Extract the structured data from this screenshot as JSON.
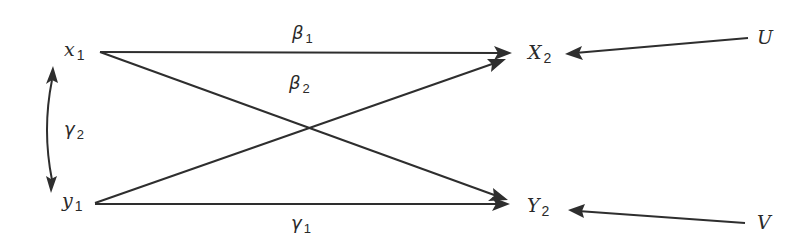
{
  "diagram": {
    "type": "path-diagram",
    "nodes": {
      "x1": {
        "base": "x",
        "sub": "1"
      },
      "y1": {
        "base": "y",
        "sub": "1"
      },
      "X2": {
        "base": "X",
        "sub": "2"
      },
      "Y2": {
        "base": "Y",
        "sub": "2"
      },
      "U": {
        "base": "U",
        "sub": ""
      },
      "V": {
        "base": "V",
        "sub": ""
      }
    },
    "edge_labels": {
      "beta1": {
        "base": "β",
        "sub": "1"
      },
      "beta2": {
        "base": "β",
        "sub": "2"
      },
      "gamma1": {
        "base": "γ",
        "sub": "1"
      },
      "gamma2": {
        "base": "γ",
        "sub": "2"
      }
    },
    "edges": [
      {
        "from": "x1",
        "to": "X2",
        "label": "β1"
      },
      {
        "from": "x1",
        "to": "Y2",
        "label": ""
      },
      {
        "from": "y1",
        "to": "X2",
        "label": "β2"
      },
      {
        "from": "y1",
        "to": "Y2",
        "label": "γ1"
      },
      {
        "from": "x1",
        "to": "y1",
        "label": "γ2",
        "bidirectional": true
      },
      {
        "from": "U",
        "to": "X2",
        "label": ""
      },
      {
        "from": "V",
        "to": "Y2",
        "label": ""
      }
    ],
    "colors": {
      "stroke": "#2e2e2e",
      "text": "#2a2a2a",
      "background": "#ffffff"
    }
  }
}
